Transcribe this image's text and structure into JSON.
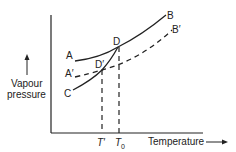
{
  "diagram": {
    "y_axis_label_line1": "Vapour",
    "y_axis_label_line2": "pressure",
    "x_axis_label": "Temperature",
    "x_axis_arrow": "→",
    "points": {
      "A": "A",
      "A_prime": "A′",
      "B": "B",
      "B_prime": "B′",
      "C": "C",
      "D": "D",
      "D_prime": "D′"
    },
    "ticks": {
      "T_prime": "T′",
      "T0_main": "T",
      "T0_sub": "0"
    },
    "curves": [
      {
        "name": "AB",
        "style": "solid",
        "description": "vapour pressure of pure solvent"
      },
      {
        "name": "A'B'",
        "style": "dashed",
        "description": "vapour pressure of solution"
      },
      {
        "name": "CD",
        "style": "solid",
        "description": "vapour pressure of solid solvent"
      }
    ],
    "colors": {
      "ink": "#222222",
      "background": "#ffffff"
    }
  }
}
